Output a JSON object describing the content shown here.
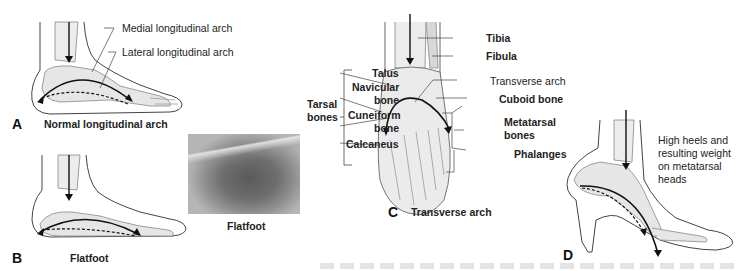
{
  "figure": {
    "panels": [
      {
        "letter": "A",
        "caption": "Normal longitudinal arch",
        "labels": [
          "Medial longitudinal arch",
          "Lateral longitudinal arch"
        ]
      },
      {
        "letter": "B",
        "caption": "Flatfoot",
        "photo_caption": "Flatfoot"
      },
      {
        "letter": "C",
        "caption": "Transverse arch",
        "labels": {
          "tibia": "Tibia",
          "fibula": "Fibula",
          "talus": "Talus",
          "navicular": "Navicular bone",
          "navicular_line1": "Navicular",
          "navicular_line2": "bone",
          "tarsal_line1": "Tarsal",
          "tarsal_line2": "bones",
          "transverse_arch": "Transverse arch",
          "cuboid": "Cuboid bone",
          "cuneiform_line1": "Cuneiform",
          "cuneiform_line2": "bone",
          "metatarsal_line1": "Metatarsal",
          "metatarsal_line2": "bones",
          "calcaneus": "Calcaneus",
          "phalanges": "Phalanges"
        }
      },
      {
        "letter": "D",
        "note_lines": [
          "High heels and",
          "resulting weight",
          "on metatarsal",
          "heads"
        ]
      }
    ],
    "colors": {
      "line": "#222222",
      "bone_fill": "#e9e9e9",
      "outline": "#555555",
      "background": "#ffffff"
    }
  }
}
